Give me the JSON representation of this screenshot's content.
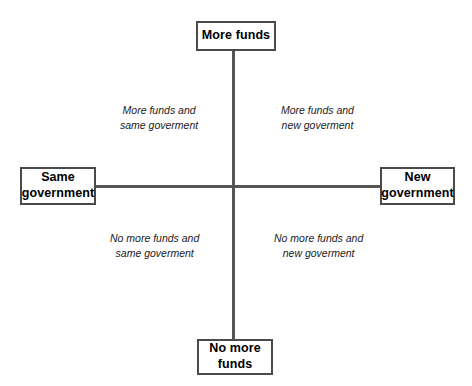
{
  "diagram": {
    "type": "two-by-two-quadrant-matrix",
    "colors": {
      "background": "#ffffff",
      "axis_line": "#555555",
      "box_border": "#4a4a4a",
      "box_fill": "#ffffff",
      "box_text": "#000000",
      "quadrant_text": "#1a1a1a"
    },
    "poles": {
      "top": {
        "label": "More funds",
        "line1": "More funds",
        "line2": ""
      },
      "bottom": {
        "label": "No more funds",
        "line1": "No more",
        "line2": "funds"
      },
      "left": {
        "label": "Same government",
        "line1": "Same",
        "line2": "government"
      },
      "right": {
        "label": "New government",
        "line1": "New",
        "line2": "government"
      }
    },
    "quadrants": {
      "top_left": {
        "line1": "More funds and",
        "line2": "same goverment"
      },
      "top_right": {
        "line1": "More funds and",
        "line2": "new goverment"
      },
      "bottom_left": {
        "line1": "No more funds and",
        "line2": "same goverment"
      },
      "bottom_right": {
        "line1": "No more funds and",
        "line2": "new goverment"
      }
    }
  }
}
